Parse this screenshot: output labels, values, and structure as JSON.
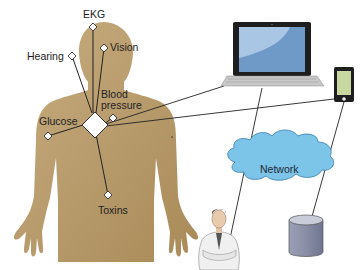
{
  "figure": {
    "type": "body sensor network diagram",
    "colors": {
      "body": "#b89a6a",
      "body_light": "#c7ad80",
      "sensor_fill": "#ffffff",
      "line": "#222222",
      "laptop_frame": "#1e1e1e",
      "laptop_screen": "#6f9ac8",
      "laptop_screen_highlight": "#a9c6e4",
      "keyboard": "#c8c8c8",
      "phone_screen": "#c8d8a0",
      "cloud": "#7cc4e8",
      "cloud_stroke": "#3a7fa8",
      "database": "#8a8fa6",
      "database_top": "#c9cdd9"
    }
  },
  "sensors": [
    {
      "id": "ekg",
      "label": "EKG"
    },
    {
      "id": "vision",
      "label": "Vision"
    },
    {
      "id": "hearing",
      "label": "Hearing"
    },
    {
      "id": "blood_pressure",
      "label": "Blood\npressure"
    },
    {
      "id": "glucose",
      "label": "Glucose"
    },
    {
      "id": "toxins",
      "label": "Toxins"
    }
  ],
  "hub": {
    "label": ""
  },
  "devices": {
    "laptop": {
      "label": ""
    },
    "phone": {
      "label": ""
    },
    "network": {
      "label": "Network"
    },
    "doctor": {
      "label": ""
    },
    "database": {
      "label": ""
    }
  }
}
